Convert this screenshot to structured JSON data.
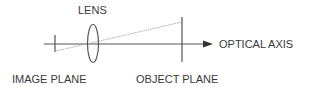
{
  "diagram": {
    "labels": {
      "lens": "LENS",
      "optical_axis": "OPTICAL AXIS",
      "image_plane": "IMAGE PLANE",
      "object_plane": "OBJECT PLANE"
    },
    "colors": {
      "line": "#555555",
      "ray": "#b0b0b0",
      "text": "#3a3a3a",
      "background": "#ffffff"
    },
    "elements": [
      {
        "name": "optical-axis",
        "type": "arrow-line"
      },
      {
        "name": "image-plane",
        "type": "vertical-line"
      },
      {
        "name": "lens",
        "type": "ellipse"
      },
      {
        "name": "object-plane",
        "type": "vertical-line"
      },
      {
        "name": "light-ray",
        "type": "dotted-line"
      }
    ]
  }
}
